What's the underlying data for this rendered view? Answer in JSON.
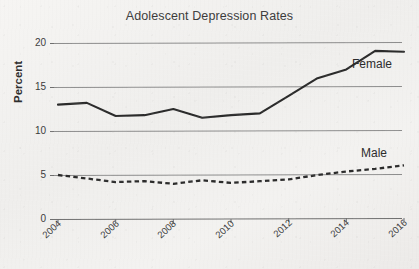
{
  "chart_data": {
    "type": "line",
    "title": "Adolescent Depression Rates",
    "xlabel": "",
    "ylabel": "Percent",
    "xlim": [
      2004,
      2016
    ],
    "ylim": [
      0,
      20
    ],
    "yticks": [
      0,
      5,
      10,
      15,
      20
    ],
    "xticks": [
      2004,
      2006,
      2008,
      2010,
      2012,
      2014,
      2016
    ],
    "grid": "horizontal",
    "legend_position": "inline-right-of-series",
    "x": [
      2004,
      2005,
      2006,
      2007,
      2008,
      2009,
      2010,
      2011,
      2012,
      2013,
      2014,
      2015,
      2016
    ],
    "series": [
      {
        "name": "Female",
        "style": "solid",
        "color": "#2b2b2b",
        "values": [
          13.0,
          13.2,
          11.7,
          11.8,
          12.5,
          11.5,
          11.8,
          12.0,
          14.0,
          16.0,
          17.0,
          19.1,
          19.0
        ]
      },
      {
        "name": "Male",
        "style": "dashed",
        "color": "#2b2b2b",
        "values": [
          5.0,
          4.6,
          4.2,
          4.3,
          4.0,
          4.4,
          4.1,
          4.3,
          4.5,
          5.0,
          5.4,
          5.7,
          6.1
        ]
      }
    ]
  },
  "labels": {
    "title": "Adolescent Depression Rates",
    "y_axis_title": "Percent",
    "female": "Female",
    "male": "Male",
    "ytick_0": "0",
    "ytick_1": "5",
    "ytick_2": "10",
    "ytick_3": "15",
    "ytick_4": "20",
    "xtick_0": "2004",
    "xtick_1": "2006",
    "xtick_2": "2008",
    "xtick_3": "2010",
    "xtick_4": "2012",
    "xtick_5": "2014",
    "xtick_6": "2016"
  },
  "colors": {
    "ink": "#2b2b2b",
    "grid": "#8b8b8b",
    "paper": "#f1f0ee"
  }
}
